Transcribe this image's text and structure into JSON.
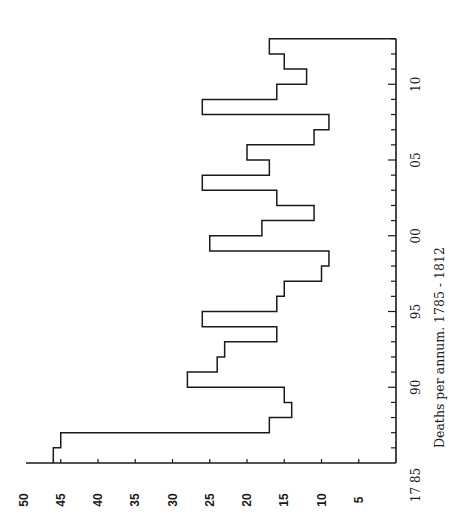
{
  "chart_data": {
    "type": "bar",
    "style": "step-histogram",
    "orientation": "rotated-90-ccw",
    "title": "Deaths per annum.  1785 - 1812",
    "xlabel": "Year",
    "ylabel": "Deaths per annum",
    "years": [
      1785,
      1786,
      1787,
      1788,
      1789,
      1790,
      1791,
      1792,
      1793,
      1794,
      1795,
      1796,
      1797,
      1798,
      1799,
      1800,
      1801,
      1802,
      1803,
      1804,
      1805,
      1806,
      1807,
      1808,
      1809,
      1810,
      1811,
      1812
    ],
    "values": [
      46,
      45,
      17,
      14,
      15,
      28,
      24,
      23,
      16,
      26,
      16,
      15,
      10,
      9,
      25,
      18,
      11,
      16,
      26,
      17,
      20,
      11,
      9,
      26,
      16,
      12,
      15,
      17
    ],
    "ylim": [
      0,
      50
    ],
    "value_ticks": [
      "5",
      "10",
      "15",
      "20",
      "25",
      "30",
      "35",
      "40",
      "45",
      "50"
    ],
    "year_tick_labels": [
      {
        "year": 1785,
        "label": "17 85"
      },
      {
        "year": 1790,
        "label": "90"
      },
      {
        "year": 1795,
        "label": "95"
      },
      {
        "year": 1800,
        "label": "00"
      },
      {
        "year": 1805,
        "label": "05"
      },
      {
        "year": 1810,
        "label": "10"
      }
    ],
    "grid": false,
    "legend": "none"
  }
}
